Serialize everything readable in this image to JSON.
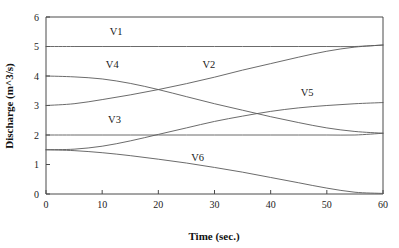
{
  "chart_data": {
    "type": "line",
    "title": "",
    "xlabel": "Time (sec.)",
    "ylabel": "Discharge (m^3/s)",
    "xlim": [
      0,
      60
    ],
    "ylim": [
      0,
      6
    ],
    "xticks": [
      0,
      10,
      20,
      30,
      40,
      50,
      60
    ],
    "xtick_labels": [
      "0",
      "10",
      "20",
      "30",
      "40",
      "50",
      "60"
    ],
    "yticks": [
      0,
      1,
      2,
      3,
      4,
      5,
      6
    ],
    "ytick_labels": [
      "0",
      "1",
      "2",
      "3",
      "4",
      "5",
      "6"
    ],
    "grid": false,
    "legend_position": "inline-labels",
    "line_color": "#5a5a5a",
    "axis_color": "#4a4a4a",
    "x": [
      0,
      5,
      10,
      15,
      20,
      25,
      30,
      35,
      40,
      45,
      50,
      55,
      60
    ],
    "series": [
      {
        "name": "V1",
        "label": "V1",
        "label_x": 12.5,
        "label_y": 5.38,
        "values": [
          5.0,
          5.0,
          5.0,
          5.0,
          5.0,
          5.0,
          5.0,
          5.0,
          5.0,
          5.0,
          5.0,
          5.0,
          5.05
        ]
      },
      {
        "name": "V2",
        "label": "V2",
        "label_x": 29.0,
        "label_y": 4.28,
        "values": [
          3.0,
          3.06,
          3.2,
          3.36,
          3.54,
          3.74,
          3.96,
          4.2,
          4.42,
          4.64,
          4.84,
          4.98,
          5.05
        ]
      },
      {
        "name": "V3",
        "label": "V3",
        "label_x": 12.2,
        "label_y": 2.4,
        "values": [
          2.0,
          2.0,
          2.0,
          2.0,
          2.0,
          2.0,
          2.0,
          2.0,
          2.0,
          2.0,
          2.0,
          2.0,
          2.06
        ]
      },
      {
        "name": "V4",
        "label": "V4",
        "label_x": 11.8,
        "label_y": 4.26,
        "values": [
          4.0,
          3.97,
          3.9,
          3.75,
          3.54,
          3.3,
          3.06,
          2.84,
          2.62,
          2.42,
          2.24,
          2.12,
          2.06
        ]
      },
      {
        "name": "V5",
        "label": "V5",
        "label_x": 46.5,
        "label_y": 3.32,
        "values": [
          1.5,
          1.52,
          1.62,
          1.8,
          2.02,
          2.24,
          2.46,
          2.64,
          2.8,
          2.92,
          3.0,
          3.06,
          3.1
        ]
      },
      {
        "name": "V6",
        "label": "V6",
        "label_x": 27.0,
        "label_y": 1.12,
        "values": [
          1.5,
          1.47,
          1.4,
          1.3,
          1.18,
          1.05,
          0.9,
          0.74,
          0.56,
          0.38,
          0.2,
          0.06,
          0.02
        ]
      }
    ]
  }
}
